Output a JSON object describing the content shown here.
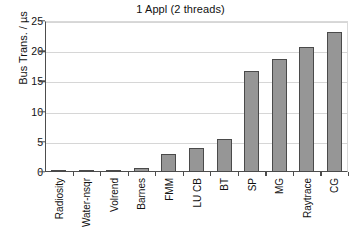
{
  "chart_data": {
    "type": "bar",
    "title": "1 Appl (2 threads)",
    "xlabel": "",
    "ylabel": "Bus Trans. / µs",
    "categories": [
      "Radiosity",
      "Water-nsqr",
      "Volrend",
      "Barnes",
      "FMM",
      "LU CB",
      "BT",
      "SP",
      "MG",
      "Raytrace",
      "CG"
    ],
    "values": [
      0.4,
      0.4,
      0.4,
      0.7,
      2.9,
      3.9,
      5.4,
      16.8,
      18.7,
      20.7,
      23.2
    ],
    "ylim": [
      0,
      25
    ],
    "yticks": [
      0,
      5,
      10,
      15,
      20,
      25
    ],
    "ytick_labels": [
      "0",
      "5",
      "10",
      "15",
      "20",
      "25"
    ],
    "grid": "horizontal",
    "legend": "none",
    "bar_color": "#969696",
    "bar_border_color": "#4a4a4a",
    "axis_color": "#4d4d4d",
    "gridline_color": "#d6d6d6",
    "background": "#ffffff"
  }
}
